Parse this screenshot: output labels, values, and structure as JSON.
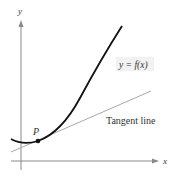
{
  "diagram": {
    "type": "tangent-line-illustration",
    "axes": {
      "x_label": "x",
      "y_label": "y",
      "color": "#8a8a8a"
    },
    "curve": {
      "label": "y = f(x)",
      "color": "#111111"
    },
    "tangent": {
      "label": "Tangent line",
      "color": "#a8a8a8"
    },
    "point": {
      "label": "P",
      "color": "#111111"
    },
    "label_box_color": "#f2f2f2"
  }
}
